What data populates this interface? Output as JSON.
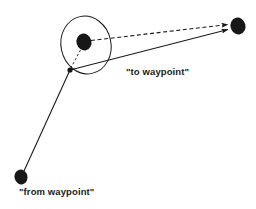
{
  "diagram": {
    "background_color": "#ffffff",
    "stroke_color": "#1b1b1b",
    "labels": {
      "to_waypoint": "\"to waypoint\"",
      "from_waypoint": "\"from waypoint\""
    },
    "nodes": [
      {
        "id": "current-position",
        "label": "current position node",
        "x": 84,
        "y": 42,
        "rx": 7.5,
        "ry": 8.5,
        "fill": "#171717"
      },
      {
        "id": "to-waypoint-node",
        "label": "to waypoint node",
        "x": 238,
        "y": 26,
        "rx": 7.5,
        "ry": 8.5,
        "fill": "#171717"
      },
      {
        "id": "from-waypoint-node",
        "label": "from waypoint node",
        "x": 21,
        "y": 177,
        "rx": 6.5,
        "ry": 7.5,
        "fill": "#171717"
      },
      {
        "id": "track-junction",
        "label": "track intersection point",
        "x": 70,
        "y": 70,
        "rx": 2.6,
        "ry": 2.6,
        "fill": "#171717"
      }
    ],
    "uncertainty_ellipse": {
      "id": "uncertainty-ellipse",
      "cx": 86,
      "cy": 45,
      "rx": 25,
      "ry": 29,
      "rotation": -12,
      "stroke_width": 1.0
    },
    "edges": [
      {
        "id": "from-waypoint-leg",
        "style": "solid",
        "x1": 24,
        "y1": 171,
        "x2": 70,
        "y2": 70,
        "arrow": false,
        "stroke_width": 1.1
      },
      {
        "id": "course-line",
        "style": "solid",
        "x1": 70,
        "y1": 70,
        "x2": 229,
        "y2": 29,
        "arrow": true,
        "stroke_width": 1.1
      },
      {
        "id": "bearing-line",
        "style": "dashed",
        "x1": 91,
        "y1": 40,
        "x2": 229,
        "y2": 24,
        "arrow": true,
        "stroke_width": 1.1,
        "dash": "4,2.6"
      },
      {
        "id": "cross-track-line",
        "style": "dashed",
        "x1": 81,
        "y1": 49,
        "x2": 70,
        "y2": 69,
        "arrow": false,
        "stroke_width": 0.9,
        "dash": "2.4,2.2"
      }
    ]
  }
}
